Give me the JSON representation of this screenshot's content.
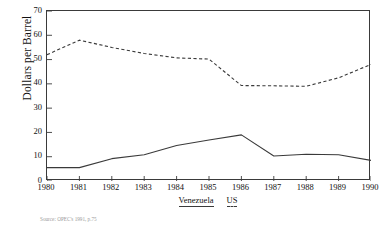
{
  "chart_data": {
    "type": "line",
    "title": "",
    "xlabel": "",
    "ylabel": "Dollars per Barrel",
    "x": [
      1980,
      1981,
      1982,
      1983,
      1984,
      1985,
      1986,
      1987,
      1988,
      1989,
      1990
    ],
    "xtick_labels": [
      "1980",
      "1981",
      "1982",
      "1983",
      "1984",
      "1985",
      "1986",
      "1987",
      "1988",
      "1989",
      "1990"
    ],
    "ytick_labels": [
      "0",
      "10",
      "20",
      "30",
      "40",
      "50",
      "60",
      "70"
    ],
    "yticks": [
      0,
      10,
      20,
      30,
      40,
      50,
      60,
      70
    ],
    "ylim": [
      0,
      70
    ],
    "xlim": [
      1980,
      1990
    ],
    "grid": false,
    "legend_position": "below-axis",
    "series": [
      {
        "name": "Venezuela",
        "style": "solid",
        "color": "#3a3a3a",
        "values": [
          5.5,
          5.5,
          9.2,
          10.8,
          14.6,
          16.9,
          19.0,
          10.3,
          11.0,
          10.8,
          8.5
        ]
      },
      {
        "name": "US",
        "style": "dashed",
        "color": "#3a3a3a",
        "values": [
          52.0,
          58.0,
          55.0,
          52.5,
          50.7,
          50.2,
          39.3,
          39.2,
          39.0,
          42.5,
          48.0
        ]
      }
    ]
  },
  "legend": {
    "items": [
      {
        "label": "Venezuela",
        "style": "solid"
      },
      {
        "label": "US",
        "style": "dashed"
      }
    ]
  },
  "source": {
    "note": "Source: OPEC's  1991, p.75"
  }
}
